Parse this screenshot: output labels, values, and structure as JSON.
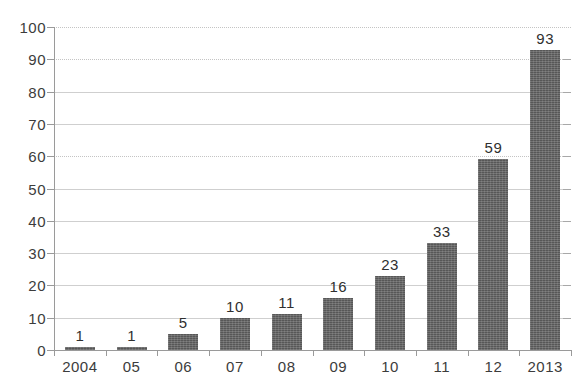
{
  "chart_data": {
    "type": "bar",
    "title": "",
    "subtitle": "",
    "xlabel": "",
    "ylabel": "",
    "categories": [
      "2004",
      "05",
      "06",
      "07",
      "08",
      "09",
      "10",
      "11",
      "12",
      "2013"
    ],
    "values": [
      1,
      1,
      5,
      10,
      11,
      16,
      23,
      33,
      59,
      93
    ],
    "data_labels": [
      "1",
      "1",
      "5",
      "10",
      "11",
      "16",
      "23",
      "33",
      "59",
      "93"
    ],
    "ylim": [
      0,
      100
    ],
    "ytick_step": 10,
    "ytick_labels": [
      "0",
      "10",
      "20",
      "30",
      "40",
      "50",
      "60",
      "70",
      "80",
      "90",
      "100"
    ],
    "grid": true,
    "grid_axis": "y",
    "legend": false,
    "legend_position": "none",
    "annotations": [],
    "colors": {
      "bar": "#575757",
      "gridline": "#cfcfcf",
      "axis": "#9a9a9a",
      "tick_label": "#3c3c3c",
      "data_label": "#2f2f2f",
      "background": "#ffffff"
    }
  }
}
